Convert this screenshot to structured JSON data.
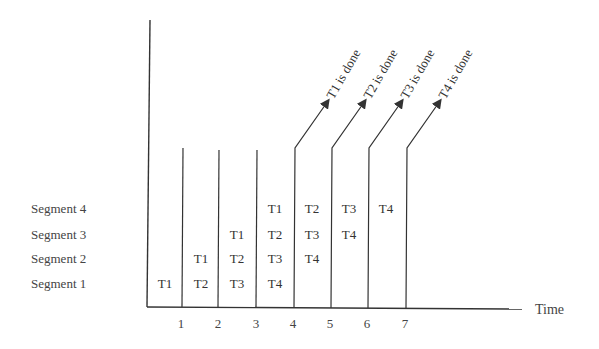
{
  "diagram": {
    "segments": [
      "Segment 1",
      "Segment 2",
      "Segment 3",
      "Segment 4"
    ],
    "x_axis_label": "Time",
    "ticks": [
      "1",
      "2",
      "3",
      "4",
      "5",
      "6",
      "7"
    ],
    "columns": [
      [
        "T1",
        "",
        "",
        ""
      ],
      [
        "T2",
        "T1",
        "",
        ""
      ],
      [
        "T3",
        "T2",
        "T1",
        ""
      ],
      [
        "T4",
        "T3",
        "T2",
        "T1"
      ],
      [
        "",
        "T4",
        "T3",
        "T2"
      ],
      [
        "",
        "",
        "T4",
        "T3"
      ],
      [
        "",
        "",
        "",
        "T4"
      ]
    ],
    "done_labels": [
      "T1 is done",
      "T2 is done",
      "T3 is done",
      "T4 is done"
    ],
    "colors": {
      "line": "#333333",
      "text": "#333333",
      "background": "#ffffff"
    }
  }
}
